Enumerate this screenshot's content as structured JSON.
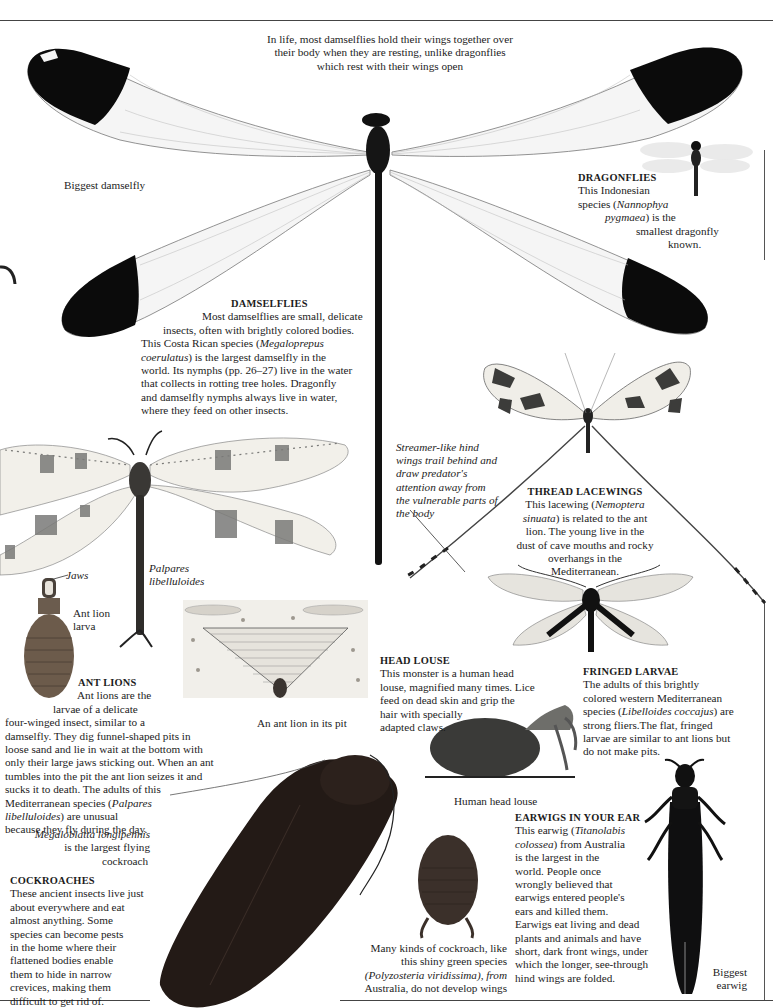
{
  "page": {
    "top_caption": "In life, most damselflies hold their wings together over their body when they are resting, unlike dragonflies which rest with their wings open",
    "top_caption_lines": [
      "In life, most damselflies hold their wings together over",
      "their body when they are resting, unlike dragonflies",
      "which rest with their wings open"
    ]
  },
  "labels": {
    "biggest_damselfly": "Biggest damselfly",
    "palpares": [
      "Palpares",
      "libelluloides"
    ],
    "jaws": "Jaws",
    "ant_lion_larva": [
      "Ant lion",
      "larva"
    ],
    "ant_lion_pit": "An ant lion in its pit",
    "human_head_louse": "Human head louse",
    "biggest_earwig": [
      "Biggest",
      "earwig"
    ],
    "streamer_note": [
      "Streamer-like hind",
      "wings trail behind and",
      "draw predator's",
      "attention away from",
      "the vulnerable parts of",
      "the body"
    ],
    "megaloblatta": [
      "Megaloblatta longipennis",
      "is the largest flying",
      "cockroach"
    ],
    "polyzosteria": [
      "Many kinds of cockroach, like",
      "this shiny green species",
      "(Polyzosteria viridissima), from",
      "Australia, do not develop wings"
    ]
  },
  "sections": {
    "dragonflies": {
      "heading": "DRAGONFLIES",
      "lines": [
        "This Indonesian",
        "species (",
        "Nannophya",
        "pygmaea",
        ") is  the",
        "smallest dragonfly",
        "known."
      ]
    },
    "damselflies": {
      "heading": "DAMSELFLIES",
      "lines": [
        "Most damselflies are small, delicate",
        "insects, often with brightly colored bodies.",
        "This Costa Rican species (",
        "Megaloprepus",
        "coerulatus",
        ") is the largest damselfly in the",
        "world. Its nymphs (pp. 26–27) live in the water",
        "that collects in rotting tree holes. Dragonfly",
        "and damselfly nymphs always live in water,",
        "where they feed on other insects."
      ]
    },
    "thread_lacewings": {
      "heading": "THREAD LACEWINGS",
      "lines": [
        "This lacewing (",
        "Nemoptera",
        "sinuata",
        ") is related to the ant",
        "lion. The young live in the",
        "dust of cave mouths and rocky",
        "overhangs in the",
        "Mediterranean."
      ]
    },
    "ant_lions": {
      "heading": "ANT LIONS",
      "lines": [
        "Ant lions are the",
        "larvae of a delicate",
        "four-winged insect, similar to a",
        "damselfly. They dig funnel-shaped pits in",
        "loose sand and lie in wait at the bottom with",
        "only their large jaws sticking out. When an ant",
        "tumbles into the pit the ant lion seizes it and",
        "sucks it to death. The adults of this",
        "Mediterranean species (",
        "Palpares",
        "libelluloides",
        ") are unusual",
        "because they fly during the day."
      ]
    },
    "head_louse": {
      "heading": "HEAD LOUSE",
      "lines": [
        "This monster is a human head",
        "louse, magnified many times. Lice",
        "feed on dead skin and grip the",
        "hair with specially",
        "adapted claws."
      ]
    },
    "fringed_larvae": {
      "heading": "FRINGED LARVAE",
      "lines": [
        "The adults of this brightly",
        "colored western Mediterranean",
        "species (",
        "Libelloides coccajus",
        ") are",
        "strong fliers.The flat, fringed",
        "larvae are similar to ant lions but",
        "do not make pits."
      ]
    },
    "cockroaches": {
      "heading": "COCKROACHES",
      "lines": [
        "These ancient insects live just",
        "about everywhere and eat",
        "almost anything. Some",
        "species can become pests",
        "in the home where their",
        "flattened bodies enable",
        "them to hide in narrow",
        "crevices, making them",
        "difficult to get rid of."
      ]
    },
    "earwigs": {
      "heading": "EARWIGS IN YOUR EAR",
      "lines": [
        "This earwig (",
        "Titanolabis",
        "colossea",
        ") from Australia",
        "is the largest in the",
        "world. People once",
        "wrongly believed that",
        "earwigs entered people's",
        "ears and killed them.",
        "Earwigs eat living and dead",
        "plants and animals and have",
        "short, dark front wings, under",
        "which the longer, see-through",
        "hind wings are folded."
      ]
    }
  },
  "colors": {
    "ink": "#1c1c1c",
    "wing_black": "#0b0b0b",
    "wing_clear": "#f4f4f4",
    "vein": "#9a9a9a",
    "spot_gray": "#7a7a78",
    "cockroach": "#231a16",
    "rule": "#444444"
  }
}
